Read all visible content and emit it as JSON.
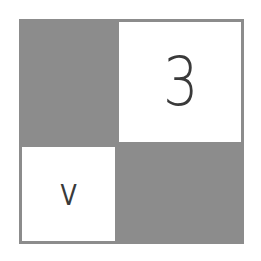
{
  "grid": {
    "colors": {
      "filled": "#8c8c8c",
      "empty": "#ffffff",
      "text": "#3a3a3a"
    },
    "cells": [
      {
        "position": "top-left",
        "fill": "gray",
        "label": ""
      },
      {
        "position": "top-right",
        "fill": "white",
        "label": "3"
      },
      {
        "position": "bottom-left",
        "fill": "white",
        "label": "V"
      },
      {
        "position": "bottom-right",
        "fill": "gray",
        "label": ""
      }
    ]
  }
}
